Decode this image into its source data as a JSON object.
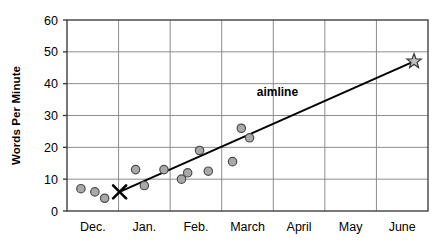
{
  "chart_data": {
    "type": "scatter",
    "title": "",
    "xlabel": "",
    "ylabel": "Words Per Minute",
    "ylim": [
      0,
      60
    ],
    "yticks": [
      0,
      10,
      20,
      30,
      40,
      50,
      60
    ],
    "ytick_labels": [
      "0",
      "10",
      "20",
      "30",
      "40",
      "50",
      "60"
    ],
    "categories": [
      "Dec.",
      "Jan.",
      "Feb.",
      "March",
      "April",
      "May",
      "June"
    ],
    "grid": true,
    "legend": false,
    "points": [
      {
        "x": 0.27,
        "y": 7,
        "label": "Dec. probe 1"
      },
      {
        "x": 0.54,
        "y": 6,
        "label": "Dec. probe 2"
      },
      {
        "x": 0.73,
        "y": 4,
        "label": "Dec. probe 3"
      },
      {
        "x": 1.33,
        "y": 13,
        "label": "Jan. probe 1"
      },
      {
        "x": 1.5,
        "y": 8,
        "label": "Jan. probe 2"
      },
      {
        "x": 1.88,
        "y": 13,
        "label": "Jan. probe 3"
      },
      {
        "x": 2.22,
        "y": 10,
        "label": "Feb. probe 1"
      },
      {
        "x": 2.34,
        "y": 12,
        "label": "Feb. probe 2"
      },
      {
        "x": 2.57,
        "y": 19,
        "label": "Feb. probe 3"
      },
      {
        "x": 2.74,
        "y": 12.5,
        "label": "Feb. probe 4"
      },
      {
        "x": 3.21,
        "y": 15.5,
        "label": "March probe 1"
      },
      {
        "x": 3.38,
        "y": 26,
        "label": "March probe 2"
      },
      {
        "x": 3.54,
        "y": 23,
        "label": "March probe 3"
      }
    ],
    "annotations": [
      {
        "name": "aimline-label",
        "text": "aimline",
        "x": 4.08,
        "y": 36
      }
    ],
    "markers": [
      {
        "name": "start-marker",
        "shape": "x",
        "x": 1.02,
        "y": 6,
        "label": "baseline start"
      },
      {
        "name": "goal-marker",
        "shape": "star",
        "x": 6.73,
        "y": 47,
        "label": "goal"
      }
    ],
    "aimline": {
      "name": "aimline",
      "from": {
        "x": 1.02,
        "y": 6
      },
      "to": {
        "x": 6.73,
        "y": 47
      }
    },
    "colors": {
      "point_fill": "#a9a9a9",
      "point_stroke": "#4d4d4d",
      "aimline": "#000000",
      "grid": "#8c8c8c",
      "axis": "#404040",
      "text": "#000000"
    }
  }
}
